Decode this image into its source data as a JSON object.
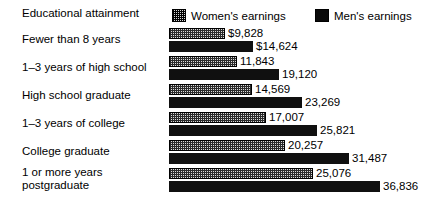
{
  "legend": {
    "title": "Educational attainment",
    "entries": [
      {
        "label": "Women's earnings",
        "swatch": "hatched-swatch-icon",
        "color": "#d6d6d6"
      },
      {
        "label": "Men's earnings",
        "swatch": "solid-black-swatch-icon",
        "color": "#000000"
      }
    ]
  },
  "chart_data": {
    "type": "bar",
    "orientation": "horizontal",
    "title": "Educational attainment",
    "xlabel": "",
    "ylabel": "Educational attainment",
    "grid": false,
    "legend_position": "top",
    "xlim": [
      0,
      36836
    ],
    "categories": [
      "Fewer than 8 years",
      "1–3 years of high school",
      "High school graduate",
      "1–3 years of college",
      "College graduate",
      "1 or more years\npostgraduate"
    ],
    "series": [
      {
        "name": "Women's earnings",
        "values": [
          9828,
          11843,
          14569,
          17007,
          20257,
          25076
        ],
        "labels": [
          "$9,828",
          "11,843",
          "14,569",
          "17,007",
          "20,257",
          "25,076"
        ]
      },
      {
        "name": "Men's earnings",
        "values": [
          14624,
          19120,
          23269,
          25821,
          31487,
          36836
        ],
        "labels": [
          "$14,624",
          "19,120",
          "23,269",
          "25,821",
          "31,487",
          "36,836"
        ]
      }
    ]
  }
}
